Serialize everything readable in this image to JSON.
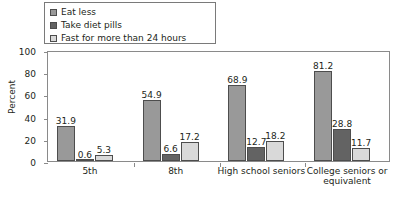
{
  "chart_data": {
    "type": "bar",
    "title": "",
    "xlabel": "",
    "ylabel": "Percent",
    "ylim": [
      0,
      100
    ],
    "yticks": [
      0,
      20,
      40,
      60,
      80,
      100
    ],
    "grid": false,
    "legend_position": "top-left",
    "categories": [
      "5th",
      "8th",
      "High school seniors",
      "College seniors or equivalent"
    ],
    "series": [
      {
        "name": "Eat less",
        "color": "#999999",
        "values": [
          31.9,
          54.9,
          68.9,
          81.2
        ],
        "labels": [
          "31.9",
          "54.9",
          "68.9",
          "81.2"
        ]
      },
      {
        "name": "Take diet pills",
        "color": "#636363",
        "values": [
          0.6,
          6.6,
          12.7,
          28.8
        ],
        "labels": [
          "0.6",
          "6.6",
          "12.7",
          "28.8"
        ]
      },
      {
        "name": "Fast for more than 24 hours",
        "color": "#d9d9d9",
        "values": [
          5.3,
          17.2,
          18.2,
          11.7
        ],
        "labels": [
          "5.3",
          "17.2",
          "18.2",
          "11.7"
        ]
      }
    ]
  },
  "axis": {
    "ytick_labels": [
      "0",
      "20",
      "40",
      "60",
      "80",
      "100"
    ],
    "ylabel": "Percent"
  },
  "legend": {
    "items": [
      {
        "label": "Eat less"
      },
      {
        "label": "Take diet pills"
      },
      {
        "label": "Fast for more than 24 hours"
      }
    ]
  },
  "categories": [
    {
      "line1": "5th",
      "line2": ""
    },
    {
      "line1": "8th",
      "line2": ""
    },
    {
      "line1": "High school seniors",
      "line2": ""
    },
    {
      "line1": "College seniors or",
      "line2": "equivalent"
    }
  ]
}
